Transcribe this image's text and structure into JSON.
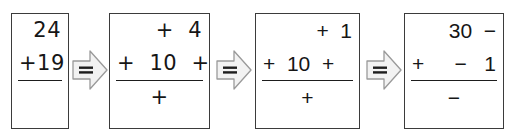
{
  "worksheet": {
    "title": "Column addition partitioning sequence",
    "orientation": "left-to-right",
    "connector_symbol": "=",
    "connector_icon": "equals-arrow-icon",
    "colors": {
      "page_background": "#ffffff",
      "box_border": "#3b3b3b",
      "text": "#161616",
      "rule": "#1d1d1d",
      "arrow_fill": "#f2f2f2",
      "arrow_stroke": "#9a9a9a"
    },
    "steps": [
      {
        "index": 1,
        "name": "original-sum",
        "top_row": {
          "left": "",
          "right": "24"
        },
        "addend_row": {
          "left": "+",
          "right": "19"
        },
        "rule": true,
        "result_row": ""
      },
      {
        "index": 2,
        "name": "partitioned-ones",
        "top_row": {
          "left": "",
          "right": "+  4"
        },
        "addend_row": {
          "left": "+  10  +",
          "right": ""
        },
        "rule": true,
        "result_row": "+"
      },
      {
        "index": 3,
        "name": "partitioned-ones-printed",
        "top_row": {
          "left": "",
          "right": "+  1"
        },
        "addend_row": {
          "left": "+  10  +",
          "right": ""
        },
        "rule": true,
        "result_row": "+"
      },
      {
        "index": 4,
        "name": "partitioned-tens",
        "top_row": {
          "left": "",
          "right": "30  −"
        },
        "addend_row": {
          "left": "+",
          "right": "−   1"
        },
        "rule": true,
        "result_row": "−"
      }
    ],
    "connectors": [
      {
        "index": 1,
        "label": "=",
        "from_step": 1,
        "to_step": 2
      },
      {
        "index": 2,
        "label": "=",
        "from_step": 2,
        "to_step": 3
      },
      {
        "index": 3,
        "label": "=",
        "from_step": 3,
        "to_step": 4
      }
    ]
  }
}
